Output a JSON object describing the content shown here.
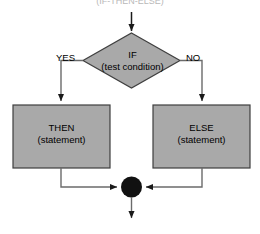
{
  "diagram": {
    "type": "flowchart",
    "title_caption": "(IF-THEN-ELSE)",
    "colors": {
      "shape_fill": "#a9a9a9",
      "shape_stroke": "#3f3f3f",
      "connector": "#6b6b6b",
      "merge_node": "#111111",
      "text": "#000000",
      "background": "#ffffff"
    },
    "decision": {
      "label": "IF",
      "sublabel": "(test condition)",
      "shape": "diamond"
    },
    "branches": {
      "yes_label": "YES",
      "no_label": "NO"
    },
    "then_box": {
      "label": "THEN",
      "sublabel": "(statement)",
      "shape": "rectangle"
    },
    "else_box": {
      "label": "ELSE",
      "sublabel": "(statement)",
      "shape": "rectangle"
    },
    "merge": {
      "shape": "filled-circle"
    }
  }
}
